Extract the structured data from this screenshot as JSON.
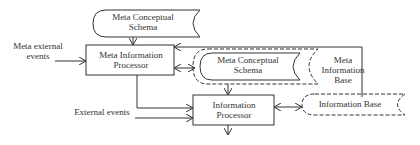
{
  "diagram": {
    "nodes": {
      "meta_conceptual_schema_top": {
        "label_line1": "Meta Conceptual",
        "label_line2": "Schema",
        "type": "store",
        "style": "solid"
      },
      "meta_information_processor": {
        "label_line1": "Meta Information",
        "label_line2": "Processor",
        "type": "process"
      },
      "meta_conceptual_schema_inner": {
        "label_line1": "Meta Conceptual",
        "label_line2": "Schema",
        "type": "store",
        "style": "solid-inside-dashed"
      },
      "meta_information_base": {
        "label_line1": "Meta",
        "label_line2": "Information",
        "label_line3": "Base",
        "type": "store",
        "style": "dashed"
      },
      "information_processor": {
        "label_line1": "Information",
        "label_line2": "Processor",
        "type": "process"
      },
      "information_base": {
        "label": "Information Base",
        "type": "store",
        "style": "dashed"
      }
    },
    "inputs": {
      "meta_external_events": {
        "label_line1": "Meta external",
        "label_line2": "events"
      },
      "external_events": {
        "label": "External events"
      }
    },
    "edges": [
      {
        "from": "meta_conceptual_schema_top",
        "to": "meta_information_processor"
      },
      {
        "from": "meta_external_events",
        "to": "meta_information_processor"
      },
      {
        "from": "meta_information_base",
        "to": "meta_information_processor"
      },
      {
        "from": "meta_information_processor",
        "to": "meta_information_base",
        "bidirectional": true
      },
      {
        "from": "meta_information_processor",
        "to": "information_processor"
      },
      {
        "from": "external_events",
        "to": "information_processor"
      },
      {
        "from": "meta_conceptual_schema_inner",
        "to": "information_processor"
      },
      {
        "from": "information_processor",
        "to": "information_base",
        "bidirectional": true
      },
      {
        "from": "information_processor",
        "to": "output"
      }
    ],
    "colors": {
      "stroke": "#333333",
      "background": "#ffffff"
    }
  }
}
